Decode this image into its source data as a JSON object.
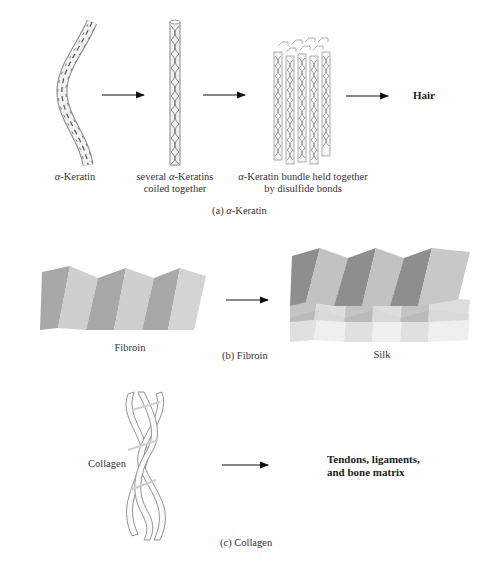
{
  "panels": {
    "a": {
      "caption_prefix": "(a) ",
      "caption_greek": "α",
      "caption_suffix": "-Keratin",
      "step1_greek": "α",
      "step1_suffix": "-Keratin",
      "step2_line1_pre": "several ",
      "step2_line1_greek": "α",
      "step2_line1_post": "-Keratins",
      "step2_line2": "coiled together",
      "step3_line1_greek": "α",
      "step3_line1_post": "-Keratin bundle held together",
      "step3_line2": "by disulfide bonds",
      "result": "Hair"
    },
    "b": {
      "caption": "(b) Fibroin",
      "left_label": "Fibroin",
      "result": "Silk"
    },
    "c": {
      "caption": "(c) Collagen",
      "left_label": "Collagen",
      "result_line1": "Tendons, ligaments,",
      "result_line2": "and bone matrix"
    }
  },
  "colors": {
    "sheet_dark": "#9a9a9a",
    "sheet_light": "#c8c8c8",
    "line": "#555555",
    "arrow": "#111111"
  }
}
